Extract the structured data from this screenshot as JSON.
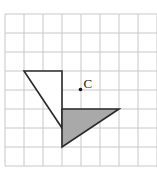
{
  "diagram": {
    "type": "grid-geometry",
    "grid": {
      "origin_x": 5,
      "origin_y": 14,
      "cell": 19,
      "cols": 8,
      "rows": 8,
      "line_color": "#c8c8c8"
    },
    "shapes": [
      {
        "name": "original-triangle",
        "fill": "#ffffff",
        "stroke": "#2a2a2a",
        "vertices_grid": [
          [
            1,
            3
          ],
          [
            3,
            3
          ],
          [
            3,
            6
          ]
        ]
      },
      {
        "name": "rotated-triangle",
        "fill": "#a9a9a9",
        "stroke": "#2a2a2a",
        "vertices_grid": [
          [
            3,
            5
          ],
          [
            6,
            5
          ],
          [
            3,
            7
          ]
        ]
      }
    ],
    "points": [
      {
        "name": "center-of-rotation",
        "label": "C",
        "grid": [
          4,
          4
        ]
      }
    ]
  }
}
